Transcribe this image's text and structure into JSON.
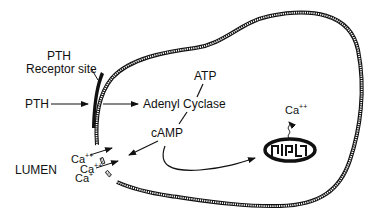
{
  "labels": {
    "pth_receptor_line1": "PTH",
    "pth_receptor_line2": "Receptor site",
    "pth": "PTH",
    "adenyl_cyclase": "Adenyl Cyclase",
    "atp": "ATP",
    "camp": "cAMP",
    "lumen": "LUMEN",
    "ca_ion": "Ca",
    "ca_charge_double": "++",
    "ca_charge_single": "+"
  },
  "colors": {
    "ink": "#111111",
    "background": "#ffffff"
  }
}
